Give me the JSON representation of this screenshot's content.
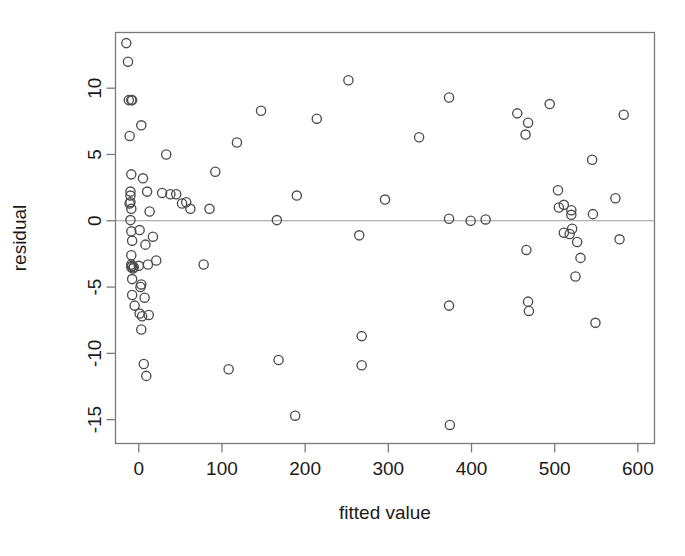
{
  "figure": {
    "title_partial": "",
    "background_color": "#ffffff",
    "point_color": "#4d4d4d",
    "axis_color": "#7a7a7a",
    "zero_line_color": "#9a9a9a"
  },
  "chart_data": {
    "type": "scatter",
    "title": "",
    "xlabel": "fitted value",
    "ylabel": "residual",
    "xlim": [
      -28,
      620
    ],
    "ylim": [
      -16.8,
      14.2
    ],
    "xticks": [
      0,
      100,
      200,
      300,
      400,
      500,
      600
    ],
    "yticks": [
      10,
      5,
      0,
      -5,
      -10,
      -15
    ],
    "xtick_labels": [
      "0",
      "100",
      "200",
      "300",
      "400",
      "500",
      "600"
    ],
    "ytick_labels": [
      "10",
      "5",
      "0",
      "-5",
      "-10",
      "-15"
    ],
    "grid": false,
    "legend": null,
    "annotations": [
      {
        "kind": "hline",
        "y": 0,
        "label": "zero residual reference line"
      }
    ],
    "marker": "open-circle",
    "n_points": 96,
    "points": [
      [
        -15,
        13.4
      ],
      [
        -13,
        12.0
      ],
      [
        -12,
        9.1
      ],
      [
        -9,
        9.1
      ],
      [
        -8,
        9.1
      ],
      [
        -11,
        6.4
      ],
      [
        3,
        7.2
      ],
      [
        -9,
        3.5
      ],
      [
        5,
        3.2
      ],
      [
        -10,
        2.2
      ],
      [
        -10,
        1.4
      ],
      [
        -11,
        1.3
      ],
      [
        10,
        2.2
      ],
      [
        13,
        0.7
      ],
      [
        28,
        2.1
      ],
      [
        38,
        2.0
      ],
      [
        33,
        5.0
      ],
      [
        52,
        1.3
      ],
      [
        62,
        0.9
      ],
      [
        -10,
        0.05
      ],
      [
        -9,
        -0.8
      ],
      [
        1,
        -0.7
      ],
      [
        -8,
        -1.5
      ],
      [
        8,
        -1.8
      ],
      [
        17,
        -1.2
      ],
      [
        -9,
        -2.6
      ],
      [
        -9,
        -3.3
      ],
      [
        -8,
        -3.4
      ],
      [
        -9,
        -3.5
      ],
      [
        11,
        -3.3
      ],
      [
        21,
        -3.0
      ],
      [
        -8,
        -4.4
      ],
      [
        3,
        -4.8
      ],
      [
        -8,
        -5.6
      ],
      [
        -5,
        -6.4
      ],
      [
        1,
        -7.0
      ],
      [
        4,
        -7.2
      ],
      [
        3,
        -8.2
      ],
      [
        6,
        -10.8
      ],
      [
        9,
        -11.7
      ],
      [
        78,
        -3.3
      ],
      [
        92,
        3.7
      ],
      [
        108,
        -11.2
      ],
      [
        118,
        5.9
      ],
      [
        147,
        8.3
      ],
      [
        166,
        0.05
      ],
      [
        168,
        -10.5
      ],
      [
        188,
        -14.7
      ],
      [
        190,
        1.9
      ],
      [
        214,
        7.7
      ],
      [
        252,
        10.6
      ],
      [
        265,
        -1.1
      ],
      [
        268,
        -8.7
      ],
      [
        268,
        -10.9
      ],
      [
        296,
        1.6
      ],
      [
        337,
        6.3
      ],
      [
        373,
        9.3
      ],
      [
        373,
        0.15
      ],
      [
        373,
        -6.4
      ],
      [
        374,
        -15.4
      ],
      [
        399,
        0.0
      ],
      [
        417,
        0.1
      ],
      [
        455,
        8.1
      ],
      [
        465,
        6.5
      ],
      [
        468,
        7.4
      ],
      [
        466,
        -2.2
      ],
      [
        468,
        -6.1
      ],
      [
        469,
        -6.8
      ],
      [
        494,
        8.8
      ],
      [
        504,
        2.3
      ],
      [
        511,
        1.2
      ],
      [
        511,
        -0.9
      ],
      [
        520,
        0.8
      ],
      [
        521,
        -0.6
      ],
      [
        520,
        0.45
      ],
      [
        527,
        -1.6
      ],
      [
        531,
        -2.8
      ],
      [
        525,
        -4.2
      ],
      [
        545,
        4.6
      ],
      [
        549,
        -7.7
      ],
      [
        573,
        1.7
      ],
      [
        583,
        8.0
      ],
      [
        578,
        -1.4
      ],
      [
        -10,
        1.9
      ],
      [
        -9,
        0.9
      ],
      [
        -7,
        -3.6
      ],
      [
        -6,
        -3.5
      ],
      [
        0,
        -3.4
      ],
      [
        2,
        -5.0
      ],
      [
        7,
        -5.8
      ],
      [
        12,
        -7.1
      ],
      [
        45,
        2.0
      ],
      [
        57,
        1.4
      ],
      [
        85,
        0.9
      ],
      [
        505,
        1.0
      ],
      [
        518,
        -1.0
      ],
      [
        546,
        0.5
      ]
    ]
  }
}
